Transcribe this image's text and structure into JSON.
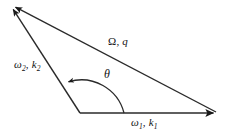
{
  "figure": {
    "background_color": "#ffffff",
    "line_color": "#1a1a1a",
    "text_color": "#111111"
  },
  "labels": {
    "top_side": {
      "symbol": "Ω",
      "comma": ", ",
      "wave": "q",
      "full": "Ω, q"
    },
    "left_side": {
      "symbol": "ω",
      "symbol_sub": "2",
      "comma": ", ",
      "wave": "k",
      "wave_sub": "2",
      "full": "ω₂, k₂"
    },
    "bottom_side": {
      "symbol": "ω",
      "symbol_sub": "1",
      "comma": ", ",
      "wave": "k",
      "wave_sub": "1",
      "full": "ω₁, k₁"
    },
    "angle": {
      "symbol": "θ",
      "full": "θ"
    }
  },
  "geometry": {
    "vertex_apex": {
      "x": 11,
      "y": 6
    },
    "vertex_origin": {
      "x": 80,
      "y": 113
    },
    "vertex_right": {
      "x": 216,
      "y": 113
    },
    "angle_arc_radius": 44,
    "arrowheads": [
      "top-side-arrow-at-apex",
      "left-side-arrow-at-apex",
      "bottom-side-arrow-at-right",
      "angle-arc-arrow"
    ]
  }
}
